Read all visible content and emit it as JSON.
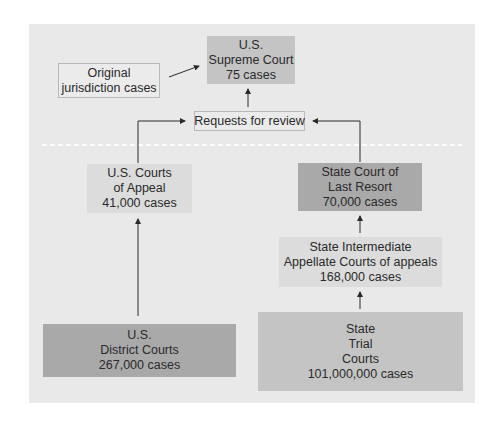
{
  "diagram": {
    "title": "",
    "nodes": {
      "supreme_court": {
        "line1": "U.S.",
        "line2": "Supreme Court",
        "line3": "75 cases"
      },
      "original_jurisdiction": {
        "line1": "Original",
        "line2": "jurisdiction cases"
      },
      "requests_for_review": {
        "line1": "Requests for review"
      },
      "us_courts_of_appeal": {
        "line1": "U.S. Courts",
        "line2": "of Appeal",
        "line3": "41,000 cases"
      },
      "state_court_last_resort": {
        "line1": "State Court of",
        "line2": "Last Resort",
        "line3": "70,000 cases"
      },
      "state_intermediate": {
        "line1": "State Intermediate",
        "line2": "Appellate Courts of appeals",
        "line3": "168,000 cases"
      },
      "us_district_courts": {
        "line1": "U.S.",
        "line2": "District Courts",
        "line3": "267,000 cases"
      },
      "state_trial_courts": {
        "line1": "State",
        "line2": "Trial",
        "line3": "Courts",
        "line4": "101,000,000 cases"
      }
    },
    "edges": [
      {
        "from": "original_jurisdiction",
        "to": "supreme_court"
      },
      {
        "from": "requests_for_review",
        "to": "supreme_court"
      },
      {
        "from": "us_courts_of_appeal",
        "to": "requests_for_review"
      },
      {
        "from": "state_court_last_resort",
        "to": "requests_for_review"
      },
      {
        "from": "us_district_courts",
        "to": "us_courts_of_appeal"
      },
      {
        "from": "state_intermediate",
        "to": "state_court_last_resort"
      },
      {
        "from": "state_trial_courts",
        "to": "state_intermediate"
      }
    ],
    "colors": {
      "panel": "#e9e9e9",
      "light_box": "#dcdcdc",
      "medium_box": "#c4c4c4",
      "dark_box": "#a9a9a9",
      "divider": "#ffffff",
      "arrow": "#2a2a2a"
    }
  }
}
